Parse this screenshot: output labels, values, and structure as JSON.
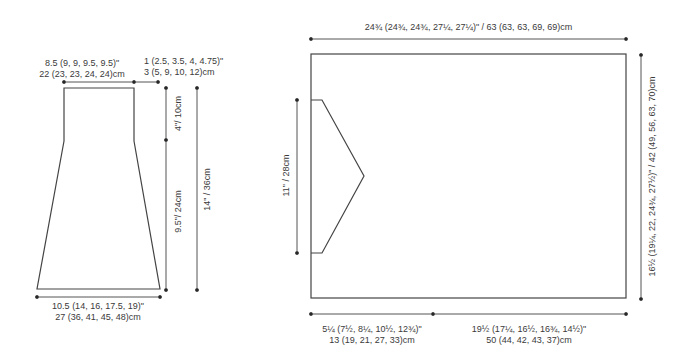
{
  "colors": {
    "outline": "#444444",
    "dimension_line": "#555555",
    "text": "#3a3a3a",
    "background": "#ffffff"
  },
  "sleeve": {
    "top_width": {
      "line1": "8.5 (9, 9, 9.5, 9.5)\"",
      "line2": "22 (23, 23, 24, 24)cm"
    },
    "cap_offset": {
      "line1": "1 (2.5, 3.5, 4, 4.75)\"",
      "line2": "3 (5, 9, 10, 12)cm"
    },
    "upper_height": "4\"/ 10cm",
    "lower_height": "9.5\"/ 24cm",
    "total_height": "14\" / 36cm",
    "bottom_width": {
      "line1": "10.5 (14, 16, 17.5, 19)\"",
      "line2": "27 (36, 41, 45, 48)cm"
    }
  },
  "body": {
    "top_width": "24¾ (24¾, 24¾, 27¼, 27¼)\" / 63 (63, 63, 69, 69)cm",
    "side_height": "16½ (19¼, 22, 24¾, 27½)\" / 42 (49, 56, 63, 70)cm",
    "armhole_height": "11\" / 28cm",
    "bottom_left": {
      "line1": "5¼ (7½, 8¼, 10½, 12¾)\"",
      "line2": "13 (19, 21, 27, 33)cm"
    },
    "bottom_right": {
      "line1": "19½ (17¼, 16½, 16¾, 14½)\"",
      "line2": "50 (44, 42, 43, 37)cm"
    }
  }
}
